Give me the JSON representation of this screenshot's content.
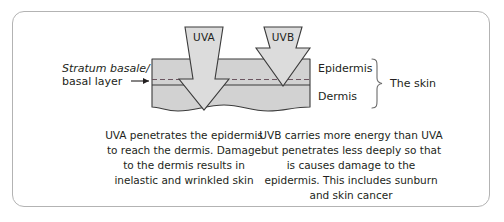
{
  "figure": {
    "frame_color": "#b3b3b3",
    "skin_fill": "#d2d2d2",
    "arrow_fill": "#dcdcdc",
    "stroke_color": "#3b3b3b"
  },
  "rays": {
    "uva": {
      "label": "UVA",
      "name": "uva-arrow",
      "depth": "dermis"
    },
    "uvb": {
      "label": "UVB",
      "name": "uvb-arrow",
      "depth": "basal layer"
    }
  },
  "skin": {
    "left_label_italic": "Stratum basale/",
    "left_label_plain": "basal layer",
    "layers": [
      {
        "name": "epidermis",
        "label": "Epidermis"
      },
      {
        "name": "dermis",
        "label": "Dermis"
      }
    ],
    "brace_label": "The skin"
  },
  "captions": {
    "uva": "UVA penetrates the epidermis to reach the dermis. Damage to the dermis results in inelastic and wrinkled skin",
    "uvb": "UVB carries more energy than UVA but penetrates less deeply so that is causes damage to the epidermis. This includes sunburn and skin cancer"
  }
}
